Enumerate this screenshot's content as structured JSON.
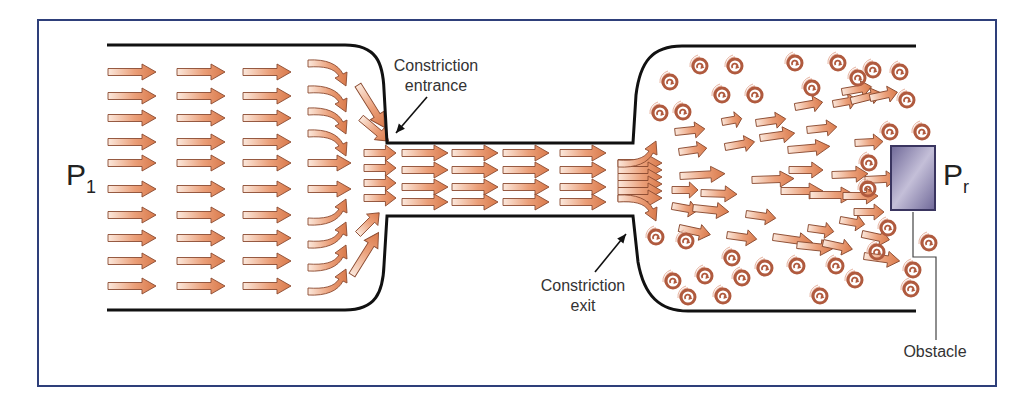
{
  "figure": {
    "colors": {
      "frame": "#2e3f7a",
      "wall": "#111111",
      "arrow_fill_tip": "#d9794a",
      "arrow_fill_tail": "#fbe8dc",
      "arrow_stroke": "#8a4a30",
      "swirl": "#b05a3e",
      "swirl_light": "#e6b3a0",
      "obstacle_dark": "#6f6898",
      "obstacle_light": "#c4bfd8",
      "obstacle_border": "#3a3560",
      "leader_line": "#444444",
      "text": "#333333"
    },
    "labels": {
      "p_in_main": "P",
      "p_in_sub": "1",
      "p_out_main": "P",
      "p_out_sub": "r",
      "entrance_line1": "Constriction",
      "entrance_line2": "entrance",
      "exit_line1": "Constriction",
      "exit_line2": "exit",
      "obstacle": "Obstacle"
    },
    "walls": {
      "top": "M107,45 L345,45 C376,45 383,62 384,90 L387,143 L633,143 L636,95 C640,62 652,46 682,46 L916,46",
      "bottom": "M107,310 L345,310 C376,310 383,292 384,265 L387,216 L633,216 L638,262 C644,296 660,311 688,311 L916,311"
    },
    "obstacle": {
      "x": 891,
      "y": 146,
      "w": 44,
      "h": 64
    },
    "leader": "M913,212 L913,257 L936,257 L936,340",
    "pointers": [
      {
        "name": "entrance-pointer",
        "x1": 427,
        "y1": 97,
        "x2": 396,
        "y2": 133
      },
      {
        "name": "exit-pointer",
        "x1": 595,
        "y1": 272,
        "x2": 626,
        "y2": 234
      }
    ],
    "straight_arrows": [
      [
        108,
        72,
        48,
        0
      ],
      [
        108,
        96,
        48,
        0
      ],
      [
        108,
        118,
        48,
        0
      ],
      [
        108,
        142,
        48,
        0
      ],
      [
        108,
        163,
        48,
        0
      ],
      [
        108,
        189,
        48,
        0
      ],
      [
        108,
        215,
        48,
        0
      ],
      [
        108,
        238,
        48,
        0
      ],
      [
        108,
        261,
        48,
        0
      ],
      [
        108,
        286,
        48,
        0
      ],
      [
        177,
        72,
        48,
        0
      ],
      [
        177,
        96,
        48,
        0
      ],
      [
        177,
        118,
        48,
        0
      ],
      [
        177,
        142,
        48,
        0
      ],
      [
        177,
        163,
        48,
        0
      ],
      [
        177,
        189,
        48,
        0
      ],
      [
        177,
        215,
        48,
        0
      ],
      [
        177,
        238,
        48,
        0
      ],
      [
        177,
        261,
        48,
        0
      ],
      [
        177,
        286,
        48,
        0
      ],
      [
        243,
        72,
        48,
        0
      ],
      [
        243,
        96,
        48,
        0
      ],
      [
        243,
        118,
        48,
        0
      ],
      [
        243,
        142,
        48,
        0
      ],
      [
        243,
        163,
        48,
        0
      ],
      [
        243,
        189,
        48,
        0
      ],
      [
        243,
        215,
        48,
        0
      ],
      [
        243,
        238,
        48,
        0
      ],
      [
        243,
        261,
        48,
        0
      ],
      [
        243,
        286,
        48,
        0
      ],
      [
        308,
        163,
        43,
        0
      ],
      [
        308,
        189,
        43,
        0
      ],
      [
        358,
        85,
        50,
        58
      ],
      [
        361,
        118,
        36,
        40
      ],
      [
        364,
        153,
        32,
        0
      ],
      [
        364,
        168,
        32,
        0
      ],
      [
        364,
        183,
        32,
        0
      ],
      [
        364,
        198,
        32,
        0
      ],
      [
        358,
        234,
        30,
        -45
      ],
      [
        352,
        275,
        50,
        -58
      ],
      [
        402,
        153,
        46,
        0
      ],
      [
        402,
        170,
        46,
        0
      ],
      [
        402,
        187,
        46,
        0
      ],
      [
        402,
        202,
        46,
        0
      ],
      [
        452,
        153,
        46,
        0
      ],
      [
        452,
        170,
        46,
        0
      ],
      [
        452,
        187,
        46,
        0
      ],
      [
        452,
        202,
        46,
        0
      ],
      [
        503,
        153,
        46,
        0
      ],
      [
        503,
        170,
        46,
        0
      ],
      [
        503,
        187,
        46,
        0
      ],
      [
        503,
        202,
        46,
        0
      ],
      [
        560,
        153,
        46,
        0
      ],
      [
        560,
        170,
        46,
        0
      ],
      [
        560,
        187,
        46,
        0
      ],
      [
        560,
        202,
        46,
        0
      ],
      [
        618,
        163,
        44,
        0
      ],
      [
        618,
        170,
        44,
        0
      ],
      [
        618,
        177,
        44,
        0
      ],
      [
        618,
        184,
        44,
        0
      ],
      [
        618,
        191,
        44,
        0
      ],
      [
        618,
        198,
        44,
        0
      ],
      [
        675,
        132,
        30,
        -6
      ],
      [
        679,
        152,
        28,
        -8
      ],
      [
        680,
        176,
        45,
        -3
      ],
      [
        672,
        190,
        26,
        0
      ],
      [
        701,
        193,
        36,
        2
      ],
      [
        672,
        206,
        26,
        10
      ],
      [
        693,
        208,
        36,
        6
      ],
      [
        679,
        228,
        32,
        12
      ],
      [
        722,
        122,
        20,
        -10
      ],
      [
        725,
        147,
        30,
        -10
      ],
      [
        752,
        180,
        42,
        -2
      ],
      [
        746,
        214,
        30,
        8
      ],
      [
        727,
        235,
        30,
        8
      ],
      [
        756,
        123,
        30,
        -8
      ],
      [
        760,
        138,
        35,
        -8
      ],
      [
        781,
        191,
        42,
        0
      ],
      [
        773,
        237,
        40,
        8
      ],
      [
        797,
        245,
        36,
        6
      ],
      [
        795,
        107,
        28,
        -10
      ],
      [
        807,
        130,
        30,
        -6
      ],
      [
        788,
        150,
        42,
        -5
      ],
      [
        789,
        170,
        34,
        0
      ],
      [
        810,
        195,
        45,
        0
      ],
      [
        808,
        228,
        26,
        8
      ],
      [
        823,
        243,
        30,
        12
      ],
      [
        833,
        104,
        24,
        -10
      ],
      [
        842,
        92,
        30,
        -10
      ],
      [
        851,
        101,
        32,
        -14
      ],
      [
        832,
        175,
        36,
        -2
      ],
      [
        843,
        196,
        35,
        0
      ],
      [
        840,
        220,
        25,
        10
      ],
      [
        862,
        234,
        28,
        12
      ],
      [
        870,
        98,
        28,
        -12
      ],
      [
        855,
        143,
        28,
        -3
      ],
      [
        865,
        180,
        32,
        -3
      ],
      [
        854,
        212,
        30,
        0
      ],
      [
        864,
        256,
        36,
        8
      ]
    ],
    "curved_arrows": [
      {
        "x": 308,
        "y": 70,
        "dir": "down"
      },
      {
        "x": 308,
        "y": 96,
        "dir": "down"
      },
      {
        "x": 308,
        "y": 118,
        "dir": "down"
      },
      {
        "x": 308,
        "y": 140,
        "dir": "down"
      },
      {
        "x": 308,
        "y": 215,
        "dir": "up"
      },
      {
        "x": 308,
        "y": 238,
        "dir": "up"
      },
      {
        "x": 308,
        "y": 261,
        "dir": "up"
      },
      {
        "x": 308,
        "y": 285,
        "dir": "up"
      },
      {
        "x": 618,
        "y": 157,
        "dir": "up"
      },
      {
        "x": 618,
        "y": 205,
        "dir": "down"
      }
    ],
    "swirls": [
      [
        700,
        66
      ],
      [
        735,
        66
      ],
      [
        670,
        82
      ],
      [
        722,
        95
      ],
      [
        755,
        95
      ],
      [
        795,
        63
      ],
      [
        838,
        63
      ],
      [
        873,
        70
      ],
      [
        900,
        72
      ],
      [
        812,
        88
      ],
      [
        858,
        78
      ],
      [
        907,
        100
      ],
      [
        660,
        113
      ],
      [
        683,
        112
      ],
      [
        890,
        132
      ],
      [
        922,
        132
      ],
      [
        869,
        163
      ],
      [
        868,
        189
      ],
      [
        656,
        237
      ],
      [
        686,
        241
      ],
      [
        732,
        258
      ],
      [
        705,
        276
      ],
      [
        673,
        281
      ],
      [
        688,
        297
      ],
      [
        742,
        278
      ],
      [
        765,
        268
      ],
      [
        797,
        266
      ],
      [
        836,
        266
      ],
      [
        855,
        280
      ],
      [
        820,
        296
      ],
      [
        911,
        289
      ],
      [
        888,
        228
      ],
      [
        929,
        243
      ],
      [
        913,
        270
      ],
      [
        877,
        252
      ],
      [
        723,
        296
      ]
    ]
  }
}
